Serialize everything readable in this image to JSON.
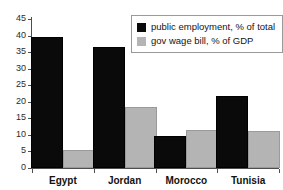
{
  "chart_data": {
    "type": "bar",
    "title": "",
    "xlabel": "",
    "ylabel": "",
    "categories": [
      "Egypt",
      "Jordan",
      "Morocco",
      "Tunisia"
    ],
    "series": [
      {
        "name": "public employment, % of total",
        "color": "#0a0a0a",
        "values": [
          39.5,
          36.5,
          9.8,
          21.8
        ]
      },
      {
        "name": "gov wage bill, % of GDP",
        "color": "#b4b4b4",
        "values": [
          5.5,
          18.5,
          11.5,
          11.2
        ]
      }
    ],
    "ylim": [
      0,
      45
    ],
    "yticks": [
      0,
      5,
      10,
      15,
      20,
      25,
      30,
      35,
      40,
      45
    ],
    "ytick_labels": [
      "0",
      "5",
      "10",
      "15",
      "20",
      "25",
      "30",
      "35",
      "40",
      "45"
    ],
    "grid": false,
    "legend_position": "top-right"
  }
}
